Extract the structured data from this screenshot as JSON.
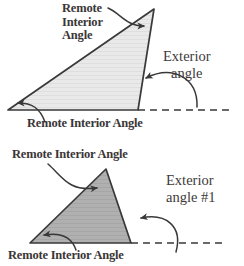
{
  "figure": {
    "colors": {
      "stroke": "#3a3838",
      "top_triangle_fill": "#e6e6e6",
      "bottom_triangle_fill": "#adadad",
      "text": "#3a3636",
      "background": "#ffffff"
    }
  },
  "top_diagram": {
    "name": "exterior-angle-diagram-1",
    "labels": {
      "remote_interior_apex": "Remote\nInterior\nAngle",
      "exterior_angle": "Exterior\nangle",
      "remote_interior_base": "Remote Interior Angle"
    },
    "geometry": {
      "apex": [
        154,
        9
      ],
      "bottom_left": [
        8,
        110
      ],
      "bottom_right": [
        138,
        110
      ],
      "dashed_extension_end": [
        232,
        110
      ]
    }
  },
  "bottom_diagram": {
    "name": "exterior-angle-diagram-2",
    "labels": {
      "remote_interior_upper": "Remote Interior Angle",
      "exterior_angle": "Exterior\nangle #1",
      "remote_interior_lower": "Remote Interior Angle"
    },
    "geometry": {
      "apex": [
        106,
        169
      ],
      "bottom_left": [
        30,
        243
      ],
      "bottom_right": [
        131,
        243
      ],
      "dashed_extension_end": [
        222,
        243
      ]
    }
  }
}
